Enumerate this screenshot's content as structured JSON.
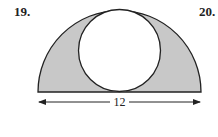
{
  "problems": [
    {
      "number": "19."
    },
    {
      "number": "20."
    }
  ],
  "figure": {
    "dimension_label": "12",
    "shade_color": "#c8c8c8",
    "stroke_color": "#222222"
  }
}
